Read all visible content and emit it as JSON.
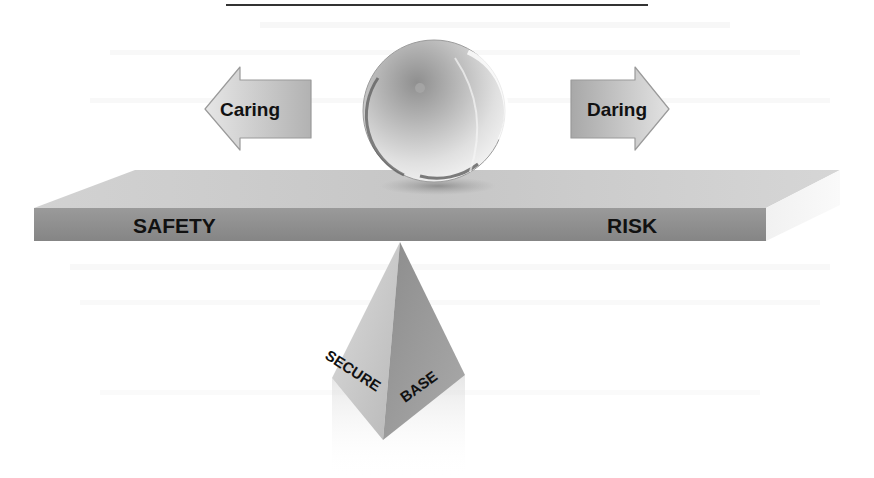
{
  "figure": {
    "arrows": {
      "left": {
        "label": "Caring",
        "direction": "left"
      },
      "right": {
        "label": "Daring",
        "direction": "right"
      }
    },
    "beam": {
      "left_label": "SAFETY",
      "right_label": "RISK"
    },
    "fulcrum": {
      "left_face_label": "SECURE",
      "right_face_label": "BASE"
    },
    "ball": {
      "description": "glass sphere balanced on beam"
    }
  },
  "colors": {
    "beam_top": "#c9c9c9",
    "beam_front": "#8f8f8f",
    "beam_end": "#ececec",
    "pyramid_left": "#c4c4c4",
    "pyramid_right": "#9a9a9a",
    "arrow_fill": "#c8c8c8",
    "text": "#111111"
  }
}
